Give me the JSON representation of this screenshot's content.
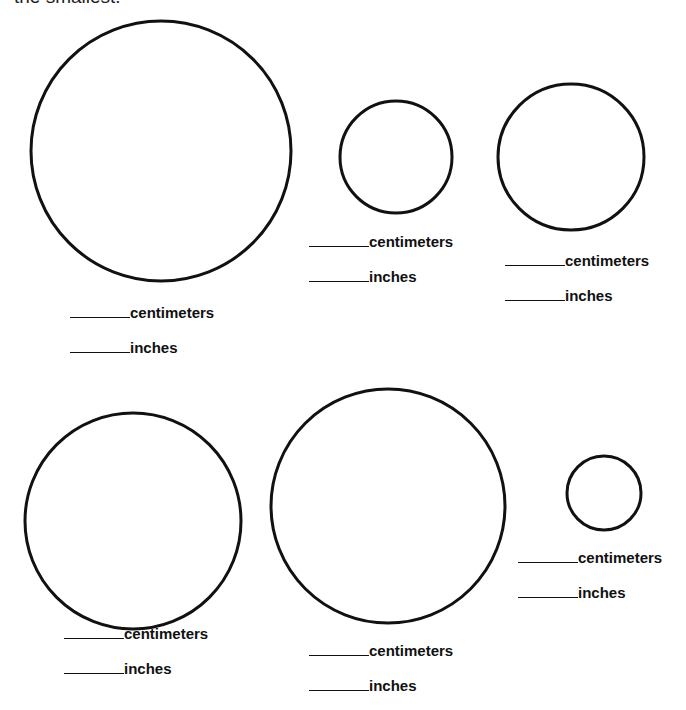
{
  "intro_text": "the smallest.",
  "units": {
    "cm": "centimeters",
    "in": "inches"
  },
  "circles": [
    {
      "id": "circle-1",
      "cm_label": "centimeters",
      "in_label": "inches",
      "cm_value": "",
      "in_value": ""
    },
    {
      "id": "circle-2",
      "cm_label": "centimeters",
      "in_label": "inches",
      "cm_value": "",
      "in_value": ""
    },
    {
      "id": "circle-3",
      "cm_label": "centimeters",
      "in_label": "inches",
      "cm_value": "",
      "in_value": ""
    },
    {
      "id": "circle-4",
      "cm_label": "centimeters",
      "in_label": "inches",
      "cm_value": "",
      "in_value": ""
    },
    {
      "id": "circle-5",
      "cm_label": "centimeters",
      "in_label": "inches",
      "cm_value": "",
      "in_value": ""
    },
    {
      "id": "circle-6",
      "cm_label": "centimeters",
      "in_label": "inches",
      "cm_value": "",
      "in_value": ""
    }
  ]
}
